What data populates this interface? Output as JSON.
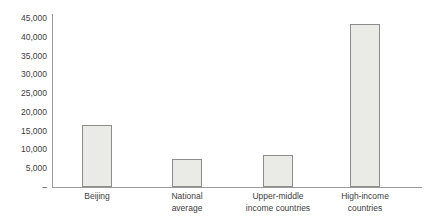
{
  "chart_data": {
    "type": "bar",
    "title": "",
    "xlabel": "",
    "ylabel": "",
    "categories": [
      "Beijing",
      "National average",
      "Upper-middle income countries",
      "High-income countries"
    ],
    "categories_lines": [
      [
        "Beijing"
      ],
      [
        "National",
        "average"
      ],
      [
        "Upper-middle",
        "income countries"
      ],
      [
        "High-income",
        "countries"
      ]
    ],
    "values": [
      16500,
      7500,
      8500,
      43500
    ],
    "ylim": [
      0,
      45000
    ],
    "ytick_step": 5000,
    "yticks": [
      {
        "label": "45,000",
        "value": 45000
      },
      {
        "label": "40,000",
        "value": 40000
      },
      {
        "label": "35,000",
        "value": 35000
      },
      {
        "label": "30,000",
        "value": 30000
      },
      {
        "label": "25,000",
        "value": 25000
      },
      {
        "label": "20,000",
        "value": 20000
      },
      {
        "label": "15,000",
        "value": 15000
      },
      {
        "label": "10,000",
        "value": 10000
      },
      {
        "label": "5,000",
        "value": 5000
      },
      {
        "label": "–",
        "value": 0
      }
    ],
    "grid": "off",
    "legend": "none",
    "bar_fill": "#eaeae7",
    "bar_border": "#8c8c8c",
    "axis_color": "#9b9b9b",
    "text_color": "#3d3d3d"
  }
}
